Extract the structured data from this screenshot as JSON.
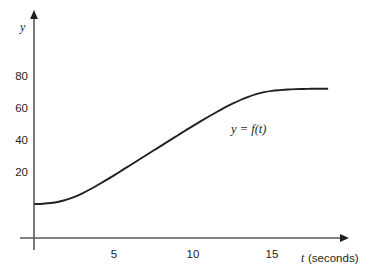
{
  "figure": {
    "background_color": "#ffffff",
    "axis_color": "#58595b",
    "curve_color": "#231f20",
    "text_color": "#231f20"
  },
  "axes": {
    "y_axis_name": "y",
    "x_axis_name": "t",
    "x_axis_unit": "(seconds)",
    "x_axis_full_label": "t (seconds)"
  },
  "curve_annotation": {
    "text": "y = f(t)",
    "lhs": "y",
    "equals": "=",
    "rhs": "f(t)"
  },
  "chart_data": {
    "type": "line",
    "title": "",
    "subtitle": "",
    "xlabel": "t (seconds)",
    "ylabel": "y",
    "grid": false,
    "legend": null,
    "annotations": [
      {
        "text": "y = f(t)",
        "x": 11.9,
        "y": 57
      }
    ],
    "xlim": [
      0,
      19.7
    ],
    "ylim": [
      0,
      90
    ],
    "xticks": [
      5,
      10,
      15
    ],
    "xticklabels": [
      "5",
      "10",
      "15"
    ],
    "yticks": [
      20,
      40,
      60,
      80
    ],
    "yticklabels": [
      "20",
      "40",
      "60",
      "80"
    ],
    "series": [
      {
        "name": "y = f(t)",
        "color": "#231f20",
        "x": [
          0.0,
          0.5,
          1.0,
          1.5,
          2.0,
          2.5,
          3.0,
          3.5,
          4.0,
          4.5,
          5.0,
          5.5,
          6.0,
          6.5,
          7.0,
          7.5,
          8.0,
          8.5,
          9.0,
          9.5,
          10.0,
          10.5,
          11.0,
          11.5,
          12.0,
          12.5,
          13.0,
          13.5,
          14.0,
          14.5,
          15.0,
          15.5,
          16.0,
          16.5,
          17.0,
          17.5,
          18.0,
          18.5
        ],
        "y": [
          0.0,
          0.2,
          0.6,
          1.4,
          2.7,
          4.5,
          6.7,
          9.2,
          12.0,
          14.9,
          17.9,
          21.0,
          24.1,
          27.2,
          30.3,
          33.4,
          36.5,
          39.6,
          42.7,
          45.8,
          48.8,
          51.8,
          54.7,
          57.5,
          60.2,
          62.7,
          65.0,
          67.0,
          68.7,
          69.9,
          70.7,
          71.2,
          71.6,
          71.8,
          71.9,
          72.0,
          72.0,
          72.0
        ]
      }
    ]
  }
}
